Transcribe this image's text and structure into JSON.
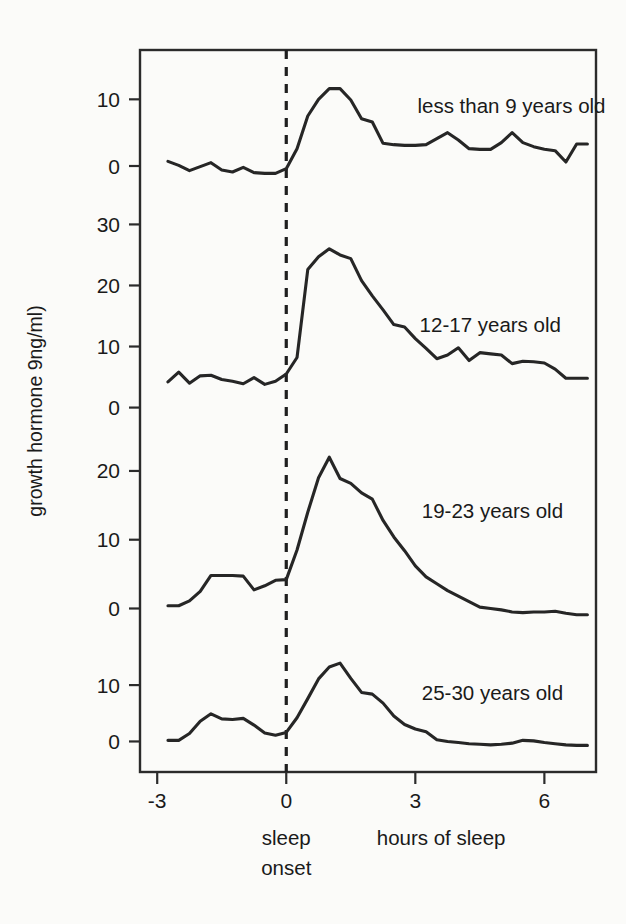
{
  "chart_data": {
    "type": "line",
    "title": "",
    "subtitle": "",
    "xlabel": "hours of sleep",
    "ylabel": "growth hormone 9ng/ml)",
    "xlim": [
      -3.4,
      7.2
    ],
    "xticks": [
      -3,
      0,
      3,
      6
    ],
    "xticklabels": [
      "-3",
      "0",
      "3",
      "6"
    ],
    "grid": false,
    "legend_position": "inline-right",
    "annotations": [
      {
        "text": "sleep",
        "x": 0,
        "position": "below-axis"
      },
      {
        "text": "onset",
        "x": 0,
        "position": "below-axis"
      },
      {
        "text": "hours of sleep",
        "x": 3.6,
        "position": "below-axis"
      }
    ],
    "reference_lines": [
      {
        "type": "vertical",
        "x": 0,
        "style": "dashed",
        "label": "sleep onset"
      }
    ],
    "panels": [
      {
        "name": "less than 9 years old",
        "label": "less than 9 years old",
        "label_x": 3.05,
        "label_y": 9.0,
        "yticks": [
          0,
          10
        ],
        "yticklabels": [
          "0",
          "10"
        ],
        "ylim": [
          -4.5,
          16.5
        ],
        "x": [
          -2.75,
          -2.5,
          -2.25,
          -2.0,
          -1.75,
          -1.5,
          -1.25,
          -1.0,
          -0.75,
          -0.5,
          -0.25,
          0.0,
          0.25,
          0.5,
          0.75,
          1.0,
          1.25,
          1.5,
          1.75,
          2.0,
          2.25,
          2.5,
          2.75,
          3.0,
          3.25,
          3.5,
          3.75,
          4.0,
          4.25,
          4.5,
          4.75,
          5.0,
          5.25,
          5.5,
          5.75,
          6.0,
          6.25,
          6.5,
          6.75,
          7.0
        ],
        "y": [
          0.7,
          0.1,
          -0.7,
          -0.1,
          0.5,
          -0.6,
          -0.9,
          -0.2,
          -1.0,
          -1.1,
          -1.1,
          -0.4,
          2.6,
          7.5,
          10.0,
          11.6,
          11.6,
          9.9,
          7.1,
          6.6,
          3.4,
          3.2,
          3.1,
          3.1,
          3.2,
          4.1,
          5.0,
          3.9,
          2.6,
          2.5,
          2.5,
          3.5,
          5.0,
          3.5,
          2.9,
          2.5,
          2.3,
          0.6,
          3.3,
          3.3
        ]
      },
      {
        "name": "12-17 years old",
        "label": "12-17 years old",
        "label_x": 3.1,
        "label_y": 13.5,
        "yticks": [
          0,
          10,
          20,
          30
        ],
        "yticklabels": [
          "0",
          "10",
          "20",
          "30"
        ],
        "ylim": [
          -4.0,
          34.0
        ],
        "x": [
          -2.75,
          -2.5,
          -2.25,
          -2.0,
          -1.75,
          -1.5,
          -1.25,
          -1.0,
          -0.75,
          -0.5,
          -0.25,
          0.0,
          0.25,
          0.5,
          0.75,
          1.0,
          1.25,
          1.5,
          1.75,
          2.0,
          2.25,
          2.5,
          2.75,
          3.0,
          3.25,
          3.5,
          3.75,
          4.0,
          4.25,
          4.5,
          4.75,
          5.0,
          5.25,
          5.5,
          5.75,
          6.0,
          6.25,
          6.5,
          6.75,
          7.0
        ],
        "y": [
          4.2,
          5.8,
          4.0,
          5.2,
          5.3,
          4.6,
          4.3,
          3.9,
          4.9,
          3.8,
          4.3,
          5.5,
          8.2,
          22.6,
          24.7,
          26.0,
          25.0,
          24.4,
          20.8,
          18.3,
          16.0,
          13.6,
          13.2,
          11.3,
          9.7,
          8.0,
          8.6,
          9.8,
          7.7,
          9.0,
          8.8,
          8.6,
          7.2,
          7.6,
          7.5,
          7.3,
          6.3,
          4.8,
          4.8,
          4.8
        ]
      },
      {
        "name": "19-23 years old",
        "label": "19-23 years old",
        "label_x": 3.15,
        "label_y": 14.2,
        "yticks": [
          0,
          10,
          20
        ],
        "yticklabels": [
          "0",
          "10",
          "20"
        ],
        "ylim": [
          -4.0,
          24.5
        ],
        "x": [
          -2.75,
          -2.5,
          -2.25,
          -2.0,
          -1.75,
          -1.5,
          -1.25,
          -1.0,
          -0.75,
          -0.5,
          -0.25,
          0.0,
          0.25,
          0.5,
          0.75,
          1.0,
          1.25,
          1.5,
          1.75,
          2.0,
          2.25,
          2.5,
          2.75,
          3.0,
          3.25,
          3.5,
          3.75,
          4.0,
          4.25,
          4.5,
          4.75,
          5.0,
          5.25,
          5.5,
          5.75,
          6.0,
          6.25,
          6.5,
          6.75,
          7.0
        ],
        "y": [
          0.4,
          0.4,
          1.1,
          2.5,
          4.8,
          4.8,
          4.8,
          4.7,
          2.7,
          3.3,
          4.1,
          4.2,
          8.5,
          14.0,
          19.0,
          22.0,
          18.9,
          18.2,
          16.8,
          15.9,
          12.8,
          10.4,
          8.4,
          6.2,
          4.6,
          3.6,
          2.6,
          1.8,
          1.0,
          0.2,
          0.0,
          -0.2,
          -0.5,
          -0.6,
          -0.5,
          -0.5,
          -0.4,
          -0.7,
          -0.9,
          -0.9
        ]
      },
      {
        "name": "25-30 years old",
        "label": "25-30 years old",
        "label_x": 3.15,
        "label_y": 8.6,
        "yticks": [
          0,
          10
        ],
        "yticklabels": [
          "0",
          "10"
        ],
        "ylim": [
          -4.0,
          18.0
        ],
        "x": [
          -2.75,
          -2.5,
          -2.25,
          -2.0,
          -1.75,
          -1.5,
          -1.25,
          -1.0,
          -0.75,
          -0.5,
          -0.25,
          0.0,
          0.25,
          0.5,
          0.75,
          1.0,
          1.25,
          1.5,
          1.75,
          2.0,
          2.25,
          2.5,
          2.75,
          3.0,
          3.25,
          3.5,
          3.75,
          4.0,
          4.25,
          4.5,
          4.75,
          5.0,
          5.25,
          5.5,
          5.75,
          6.0,
          6.25,
          6.5,
          6.75,
          7.0
        ],
        "y": [
          0.2,
          0.2,
          1.4,
          3.6,
          4.9,
          4.0,
          3.9,
          4.1,
          2.9,
          1.5,
          1.1,
          1.6,
          4.2,
          7.6,
          11.1,
          13.2,
          13.9,
          11.2,
          8.7,
          8.4,
          6.8,
          4.5,
          3.0,
          2.2,
          1.7,
          0.3,
          0.0,
          -0.2,
          -0.4,
          -0.5,
          -0.6,
          -0.5,
          -0.3,
          0.2,
          0.1,
          -0.2,
          -0.4,
          -0.6,
          -0.7,
          -0.7
        ]
      }
    ]
  },
  "axis": {
    "y_title": "growth hormone 9ng/ml)",
    "x_title": "hours of sleep",
    "onset_line1": "sleep",
    "onset_line2": "onset"
  },
  "colors": {
    "line": "#262626",
    "frame": "#2b2b2b",
    "background": "#fbfbf9",
    "text": "#1a1a1a"
  }
}
